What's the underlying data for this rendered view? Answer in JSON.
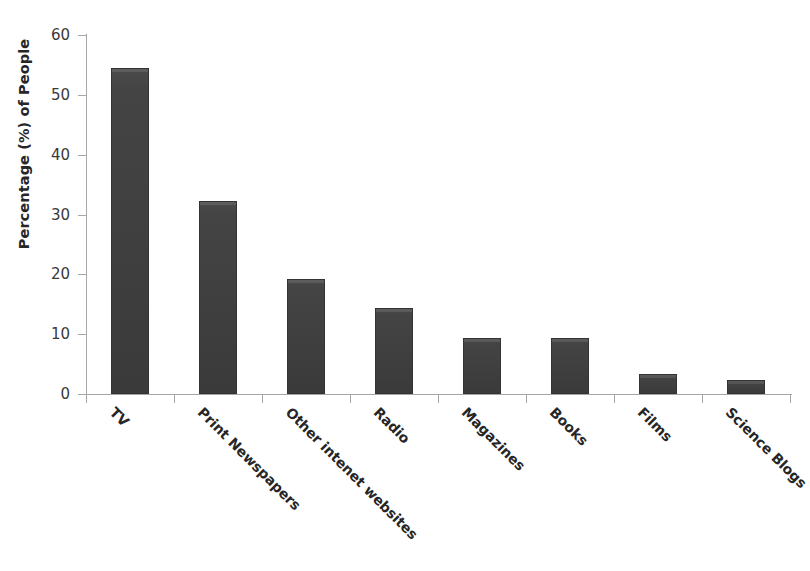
{
  "chart_data": {
    "type": "bar",
    "title": "",
    "subtitle": "",
    "xlabel": "",
    "ylabel": "Percentage (%) of People",
    "categories": [
      "TV",
      "Print Newspapers",
      "Other intenet websites",
      "Radio",
      "Magazines",
      "Books",
      "Films",
      "Science Blogs"
    ],
    "values": [
      54.5,
      32.3,
      19.3,
      14.3,
      9.4,
      9.4,
      3.4,
      2.4
    ],
    "ylim": [
      0,
      60
    ],
    "ytick_labels": [
      "0",
      "10",
      "20",
      "30",
      "40",
      "50",
      "60"
    ],
    "ytick_values": [
      0,
      10,
      20,
      30,
      40,
      50,
      60
    ],
    "grid": false,
    "legend": null,
    "legend_position": "none",
    "bar_color": "#3f3f3f",
    "axis_color": "#a6a6a6",
    "text_color": "#262626",
    "background": "#ffffff"
  }
}
